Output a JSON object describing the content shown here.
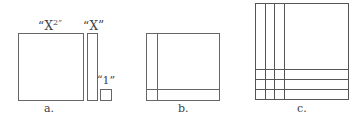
{
  "panels": [
    {
      "caption": "a.",
      "tiles": [
        {
          "name": "x-squared-tile",
          "label": "“X",
          "sup": "2",
          "close": "”"
        },
        {
          "name": "x-tile",
          "label": "“X”"
        },
        {
          "name": "unit-tile",
          "label": "“1”"
        }
      ]
    },
    {
      "caption": "b.",
      "description": "x-squared tile with one x-strip on left and one on bottom, plus unit square in corner"
    },
    {
      "caption": "c.",
      "description": "x-squared tile with three x-strips on left and three on bottom, plus 3x3 unit squares in corner"
    }
  ],
  "colors": {
    "stroke": "#555555",
    "background": "#ffffff"
  }
}
